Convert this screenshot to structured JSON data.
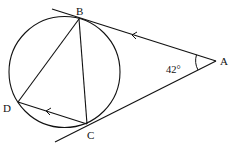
{
  "diagram": {
    "type": "circle-geometry",
    "points": {
      "A": {
        "label": "A"
      },
      "B": {
        "label": "B"
      },
      "C": {
        "label": "C"
      },
      "D": {
        "label": "D"
      }
    },
    "angle_at_A": {
      "label": "42°",
      "value_deg": 42
    },
    "relations": [
      "AB tangent to circle at B",
      "AC tangent to circle at C",
      "BD chord",
      "BC chord",
      "DC chord parallel to AB (arrow marks)"
    ],
    "colors": {
      "stroke": "#111111",
      "background": "#ffffff"
    }
  }
}
